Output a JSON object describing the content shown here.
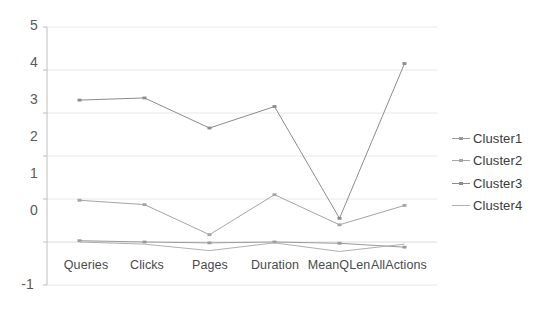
{
  "chart_data": {
    "type": "line",
    "title": "",
    "subtitle": "",
    "xlabel": "",
    "ylabel": "",
    "categories": [
      "Queries",
      "Clicks",
      "Pages",
      "Duration",
      "MeanQLen",
      "AllActions"
    ],
    "ylim": [
      -1,
      5
    ],
    "yticks": [
      "-1",
      "0",
      "1",
      "2",
      "3",
      "4",
      "5"
    ],
    "grid": true,
    "legend_position": "right",
    "series": [
      {
        "name": "Cluster1",
        "color": "#9a9a9a",
        "marker": "dash",
        "values": [
          0.03,
          0.0,
          -0.02,
          0.0,
          -0.03,
          -0.12
        ]
      },
      {
        "name": "Cluster2",
        "color": "#a5a5a5",
        "marker": "dash",
        "values": [
          0.97,
          0.87,
          0.17,
          1.1,
          0.4,
          0.85
        ]
      },
      {
        "name": "Cluster3",
        "color": "#8c8c8c",
        "marker": "dash",
        "values": [
          3.3,
          3.35,
          2.65,
          3.15,
          0.55,
          4.15
        ]
      },
      {
        "name": "Cluster4",
        "color": "#b0b0b0",
        "marker": "none",
        "values": [
          0.0,
          -0.05,
          -0.2,
          -0.02,
          -0.22,
          -0.05
        ]
      }
    ]
  },
  "axes": {
    "gridline_color": "#e8e8e8",
    "axis_color": "#bfbfbf",
    "tick_color": "#595959"
  }
}
